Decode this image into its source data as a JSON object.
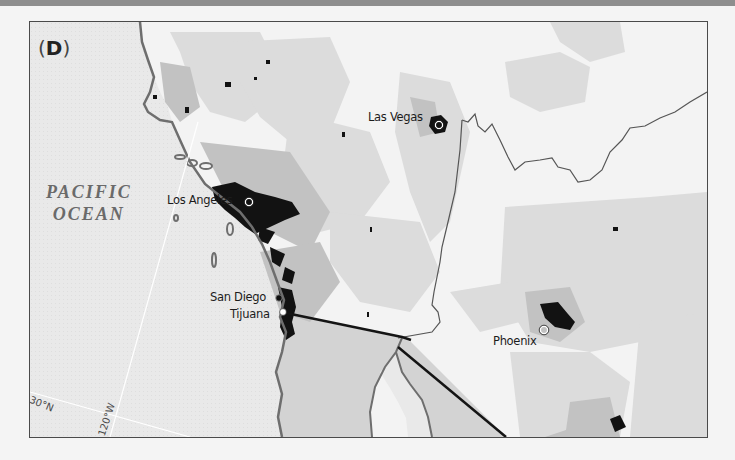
{
  "panel": {
    "label": "D",
    "paren_open": "(",
    "paren_close": ")"
  },
  "ocean": {
    "line1": "PACIFIC",
    "line2": "OCEAN"
  },
  "cities": [
    {
      "name": "Las Vegas",
      "marker": "open-circle"
    },
    {
      "name": "Los Angeles",
      "marker": "open-circle"
    },
    {
      "name": "San Diego",
      "marker": "filled-dark-circle"
    },
    {
      "name": "Tijuana",
      "marker": "filled-white-circle"
    },
    {
      "name": "Phoenix",
      "marker": "open-circle"
    }
  ],
  "graticule": {
    "lat_label": "30°N",
    "lon_label": "120°W"
  },
  "colors": {
    "ocean": "#e9e9e9",
    "land_light": "#f3f3f3",
    "density_low": "#d6d6d6",
    "density_mid": "#9a9a9a",
    "density_high": "#111111",
    "coastline": "#6e6e6e",
    "border": "#141414",
    "frame": "#4a4a4a"
  }
}
